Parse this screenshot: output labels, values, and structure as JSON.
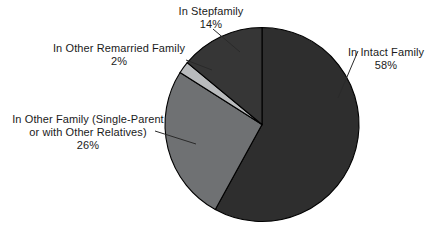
{
  "chart_data": {
    "type": "pie",
    "title": "",
    "categories": [
      "In Intact Family",
      "In Other Family (Single-Parent or with Other Relatives)",
      "In Other Remarried Family",
      "In Stepfamily"
    ],
    "values": [
      58,
      26,
      2,
      14
    ],
    "value_unit": "%",
    "start_angle_deg": 0,
    "direction": "clockwise",
    "legend": "none",
    "grid": false,
    "labels_position": "outside-with-leader-lines",
    "slice_colors": [
      "#2e2e2e",
      "#6f7173",
      "#b9bbbd",
      "#363636"
    ],
    "slice_outline_color": "#000000",
    "background_color": "#ffffff",
    "slices": [
      {
        "name": "In Intact Family",
        "value": 58,
        "label_lines": [
          "In Intact Family"
        ],
        "percent_text": "58%",
        "color": "#2e2e2e"
      },
      {
        "name": "In Other Family (Single-Parent or with Other Relatives)",
        "value": 26,
        "label_lines": [
          "In Other Family (Single-Parent",
          "or with Other Relatives)"
        ],
        "percent_text": "26%",
        "color": "#6f7173"
      },
      {
        "name": "In Other Remarried Family",
        "value": 2,
        "label_lines": [
          "In Other Remarried Family"
        ],
        "percent_text": "2%",
        "color": "#b9bbbd"
      },
      {
        "name": "In Stepfamily",
        "value": 14,
        "label_lines": [
          "In Stepfamily"
        ],
        "percent_text": "14%",
        "color": "#363636"
      }
    ]
  },
  "labels": {
    "stepfamily": {
      "line1": "In Stepfamily",
      "percent": "14%"
    },
    "remarried": {
      "line1": "In Other Remarried Family",
      "percent": "2%"
    },
    "other_family": {
      "line1": "In Other Family (Single-Parent",
      "line2": "or with Other Relatives)",
      "percent": "26%"
    },
    "intact": {
      "line1": "In Intact Family",
      "percent": "58%"
    }
  }
}
